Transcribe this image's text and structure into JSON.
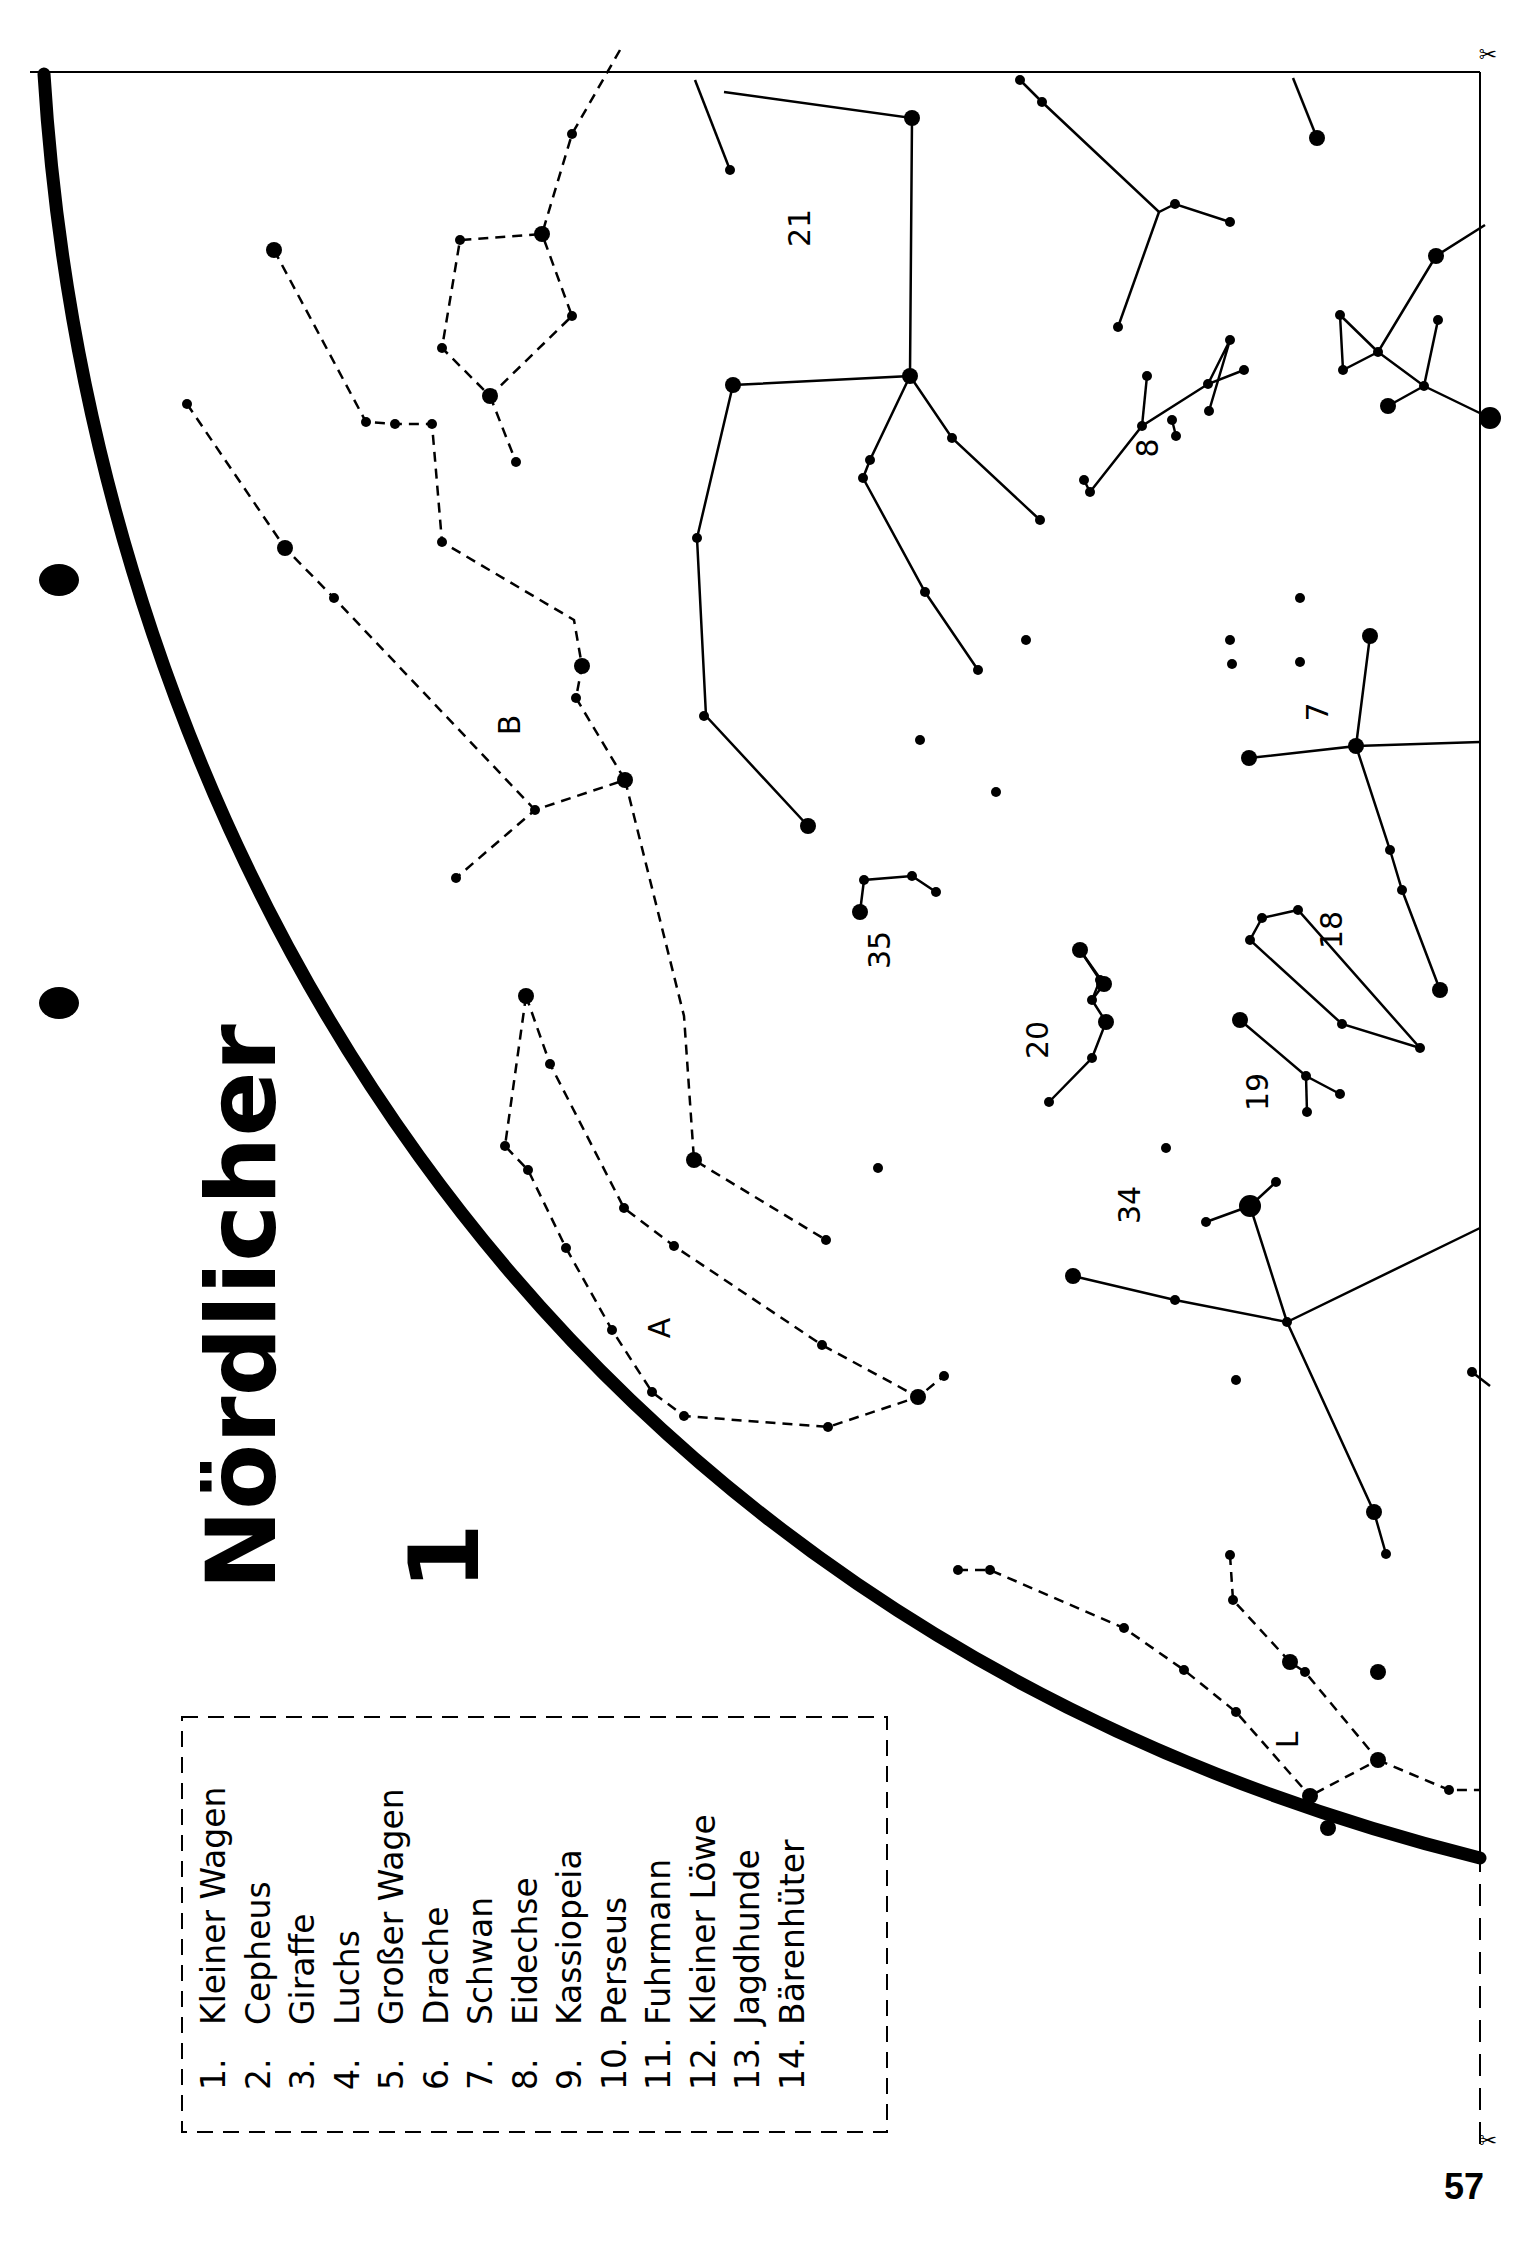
{
  "page": {
    "title": "Nördlicher",
    "sheet_number": "1",
    "page_number": "57",
    "ink_color": "#000000",
    "paper_color": "#ffffff"
  },
  "legend": {
    "items": [
      {
        "num": "1.",
        "name": "Kleiner Wagen"
      },
      {
        "num": "2.",
        "name": "Cepheus"
      },
      {
        "num": "3.",
        "name": "Giraffe"
      },
      {
        "num": "4.",
        "name": "Luchs"
      },
      {
        "num": "5.",
        "name": "Großer Wagen"
      },
      {
        "num": "6.",
        "name": "Drache"
      },
      {
        "num": "7.",
        "name": "Schwan"
      },
      {
        "num": "8.",
        "name": "Eidechse"
      },
      {
        "num": "9.",
        "name": "Kassiopeia"
      },
      {
        "num": "10.",
        "name": "Perseus"
      },
      {
        "num": "11.",
        "name": "Fuhrmann"
      },
      {
        "num": "12.",
        "name": "Kleiner Löwe"
      },
      {
        "num": "13.",
        "name": "Jagdhunde"
      },
      {
        "num": "14.",
        "name": "Bärenhüter"
      }
    ]
  },
  "map_labels": [
    {
      "id": "label-21",
      "text": "21",
      "x": 810,
      "y": 228
    },
    {
      "id": "label-8",
      "text": "8",
      "x": 1158,
      "y": 448
    },
    {
      "id": "label-7",
      "text": "7",
      "x": 1328,
      "y": 712
    },
    {
      "id": "label-18",
      "text": "18",
      "x": 1342,
      "y": 930
    },
    {
      "id": "label-35",
      "text": "35",
      "x": 890,
      "y": 950
    },
    {
      "id": "label-20",
      "text": "20",
      "x": 1048,
      "y": 1040
    },
    {
      "id": "label-19",
      "text": "19",
      "x": 1268,
      "y": 1092
    },
    {
      "id": "label-34",
      "text": "34",
      "x": 1140,
      "y": 1205
    },
    {
      "id": "label-A",
      "text": "A",
      "x": 670,
      "y": 1328
    },
    {
      "id": "label-B",
      "text": "B",
      "x": 520,
      "y": 725
    },
    {
      "id": "label-L",
      "text": "L",
      "x": 1298,
      "y": 1740
    }
  ],
  "constellations": {
    "dashed": [
      [
        [
          620,
          50
        ],
        [
          572,
          134
        ],
        [
          542,
          234
        ],
        [
          460,
          240
        ],
        [
          442,
          348
        ],
        [
          490,
          396
        ],
        [
          572,
          316
        ],
        [
          542,
          234
        ]
      ],
      [
        [
          490,
          396
        ],
        [
          516,
          462
        ]
      ],
      [
        [
          274,
          250
        ],
        [
          366,
          422
        ],
        [
          395,
          424
        ],
        [
          432,
          424
        ],
        [
          442,
          542
        ],
        [
          574,
          620
        ],
        [
          582,
          666
        ],
        [
          576,
          698
        ],
        [
          625,
          780
        ],
        [
          535,
          810
        ],
        [
          456,
          878
        ]
      ],
      [
        [
          187,
          404
        ],
        [
          285,
          548
        ],
        [
          334,
          598
        ],
        [
          535,
          810
        ]
      ],
      [
        [
          625,
          780
        ],
        [
          684,
          1016
        ],
        [
          694,
          1160
        ],
        [
          826,
          1240
        ]
      ],
      [
        [
          526,
          996
        ],
        [
          550,
          1064
        ],
        [
          624,
          1208
        ],
        [
          674,
          1246
        ],
        [
          822,
          1345
        ],
        [
          918,
          1397
        ],
        [
          944,
          1376
        ]
      ],
      [
        [
          526,
          996
        ],
        [
          505,
          1146
        ],
        [
          528,
          1170
        ],
        [
          566,
          1248
        ],
        [
          612,
          1330
        ],
        [
          652,
          1392
        ],
        [
          684,
          1416
        ],
        [
          828,
          1427
        ],
        [
          918,
          1397
        ]
      ],
      [
        [
          958,
          1570
        ],
        [
          990,
          1570
        ],
        [
          1124,
          1628
        ],
        [
          1184,
          1670
        ],
        [
          1236,
          1712
        ],
        [
          1310,
          1796
        ],
        [
          1328,
          1828
        ]
      ],
      [
        [
          1230,
          1555
        ],
        [
          1233,
          1600
        ],
        [
          1290,
          1662
        ],
        [
          1305,
          1672
        ],
        [
          1378,
          1760
        ],
        [
          1310,
          1796
        ]
      ],
      [
        [
          1378,
          1760
        ],
        [
          1449,
          1790
        ],
        [
          1480,
          1790
        ]
      ]
    ],
    "solid": [
      [
        [
          695,
          80
        ],
        [
          730,
          170
        ]
      ],
      [
        [
          724,
          92
        ],
        [
          912,
          118
        ],
        [
          910,
          376
        ],
        [
          733,
          385
        ],
        [
          697,
          538
        ],
        [
          706,
          716
        ],
        [
          808,
          826
        ]
      ],
      [
        [
          910,
          376
        ],
        [
          870,
          460
        ],
        [
          863,
          478
        ],
        [
          925,
          592
        ],
        [
          978,
          670
        ]
      ],
      [
        [
          910,
          376
        ],
        [
          952,
          438
        ],
        [
          1040,
          520
        ]
      ],
      [
        [
          1020,
          80
        ],
        [
          1042,
          102
        ],
        [
          1159,
          212
        ],
        [
          1175,
          204
        ],
        [
          1230,
          222
        ]
      ],
      [
        [
          1159,
          212
        ],
        [
          1118,
          327
        ]
      ],
      [
        [
          1293,
          78
        ],
        [
          1317,
          138
        ]
      ],
      [
        [
          1485,
          225
        ],
        [
          1436,
          256
        ],
        [
          1378,
          352
        ],
        [
          1424,
          386
        ],
        [
          1490,
          418
        ]
      ],
      [
        [
          1378,
          352
        ],
        [
          1343,
          370
        ],
        [
          1340,
          315
        ],
        [
          1378,
          352
        ]
      ],
      [
        [
          1424,
          386
        ],
        [
          1438,
          320
        ]
      ],
      [
        [
          1424,
          386
        ],
        [
          1388,
          406
        ]
      ],
      [
        [
          1084,
          480
        ],
        [
          1090,
          492
        ],
        [
          1142,
          426
        ],
        [
          1208,
          384
        ],
        [
          1244,
          370
        ]
      ],
      [
        [
          1142,
          426
        ],
        [
          1147,
          376
        ]
      ],
      [
        [
          1208,
          384
        ],
        [
          1230,
          340
        ],
        [
          1209,
          411
        ]
      ],
      [
        [
          1172,
          420
        ],
        [
          1176,
          436
        ]
      ],
      [
        [
          1370,
          636
        ],
        [
          1356,
          746
        ],
        [
          1249,
          758
        ]
      ],
      [
        [
          1356,
          746
        ],
        [
          1480,
          742
        ]
      ],
      [
        [
          1356,
          746
        ],
        [
          1390,
          850
        ],
        [
          1402,
          890
        ],
        [
          1440,
          990
        ]
      ],
      [
        [
          1262,
          918
        ],
        [
          1250,
          940
        ],
        [
          1342,
          1024
        ],
        [
          1420,
          1048
        ],
        [
          1298,
          910
        ],
        [
          1262,
          918
        ]
      ],
      [
        [
          1240,
          1020
        ],
        [
          1306,
          1076
        ],
        [
          1340,
          1094
        ]
      ],
      [
        [
          1306,
          1076
        ],
        [
          1307,
          1112
        ]
      ],
      [
        [
          860,
          912
        ],
        [
          864,
          880
        ],
        [
          912,
          876
        ],
        [
          936,
          892
        ]
      ],
      [
        [
          1080,
          950
        ],
        [
          1100,
          980
        ],
        [
          1092,
          1000
        ],
        [
          1106,
          1022
        ],
        [
          1092,
          1058
        ],
        [
          1049,
          1102
        ]
      ],
      [
        [
          1080,
          950
        ],
        [
          1104,
          984
        ]
      ],
      [
        [
          1092,
          1000
        ],
        [
          1104,
          984
        ]
      ],
      [
        [
          1073,
          1276
        ],
        [
          1175,
          1300
        ],
        [
          1287,
          1322
        ],
        [
          1480,
          1228
        ]
      ],
      [
        [
          1287,
          1322
        ],
        [
          1250,
          1206
        ],
        [
          1276,
          1182
        ]
      ],
      [
        [
          1250,
          1206
        ],
        [
          1206,
          1222
        ]
      ],
      [
        [
          1287,
          1322
        ],
        [
          1374,
          1512
        ],
        [
          1386,
          1554
        ]
      ],
      [
        [
          1472,
          1372
        ],
        [
          1490,
          1386
        ]
      ]
    ],
    "stars_small": [
      [
        572,
        134
      ],
      [
        460,
        240
      ],
      [
        442,
        348
      ],
      [
        572,
        316
      ],
      [
        516,
        462
      ],
      [
        366,
        422
      ],
      [
        395,
        424
      ],
      [
        432,
        424
      ],
      [
        442,
        542
      ],
      [
        576,
        698
      ],
      [
        535,
        810
      ],
      [
        456,
        878
      ],
      [
        187,
        404
      ],
      [
        334,
        598
      ],
      [
        694,
        1160
      ],
      [
        826,
        1240
      ],
      [
        550,
        1064
      ],
      [
        624,
        1208
      ],
      [
        674,
        1246
      ],
      [
        822,
        1345
      ],
      [
        944,
        1376
      ],
      [
        505,
        1146
      ],
      [
        528,
        1170
      ],
      [
        566,
        1248
      ],
      [
        612,
        1330
      ],
      [
        652,
        1392
      ],
      [
        684,
        1416
      ],
      [
        828,
        1427
      ],
      [
        958,
        1570
      ],
      [
        990,
        1570
      ],
      [
        1124,
        1628
      ],
      [
        1184,
        1670
      ],
      [
        1236,
        1712
      ],
      [
        1230,
        1555
      ],
      [
        1233,
        1600
      ],
      [
        1305,
        1672
      ],
      [
        1449,
        1790
      ],
      [
        730,
        170
      ],
      [
        1042,
        102
      ],
      [
        1175,
        204
      ],
      [
        1230,
        222
      ],
      [
        1118,
        327
      ],
      [
        1020,
        80
      ],
      [
        1317,
        138
      ],
      [
        870,
        460
      ],
      [
        863,
        478
      ],
      [
        925,
        592
      ],
      [
        978,
        670
      ],
      [
        952,
        438
      ],
      [
        1040,
        520
      ],
      [
        1084,
        480
      ],
      [
        1090,
        492
      ],
      [
        1142,
        426
      ],
      [
        1208,
        384
      ],
      [
        1147,
        376
      ],
      [
        1230,
        340
      ],
      [
        1209,
        411
      ],
      [
        1172,
        420
      ],
      [
        1176,
        436
      ],
      [
        1244,
        370
      ],
      [
        1343,
        370
      ],
      [
        1340,
        315
      ],
      [
        1438,
        320
      ],
      [
        1424,
        386
      ],
      [
        1378,
        352
      ],
      [
        1390,
        850
      ],
      [
        1402,
        890
      ],
      [
        1262,
        918
      ],
      [
        1250,
        940
      ],
      [
        1342,
        1024
      ],
      [
        1420,
        1048
      ],
      [
        1298,
        910
      ],
      [
        1306,
        1076
      ],
      [
        1340,
        1094
      ],
      [
        1307,
        1112
      ],
      [
        864,
        880
      ],
      [
        912,
        876
      ],
      [
        936,
        892
      ],
      [
        1092,
        1000
      ],
      [
        1100,
        980
      ],
      [
        1092,
        1058
      ],
      [
        1049,
        1102
      ],
      [
        1175,
        1300
      ],
      [
        1287,
        1322
      ],
      [
        1206,
        1222
      ],
      [
        1276,
        1182
      ],
      [
        1386,
        1554
      ],
      [
        1472,
        1372
      ],
      [
        1230,
        640
      ],
      [
        1232,
        664
      ],
      [
        1300,
        598
      ],
      [
        1300,
        662
      ],
      [
        1026,
        640
      ],
      [
        920,
        740
      ],
      [
        996,
        792
      ],
      [
        878,
        1168
      ],
      [
        1166,
        1148
      ],
      [
        1236,
        1380
      ],
      [
        704,
        716
      ],
      [
        697,
        538
      ]
    ],
    "stars_large": [
      [
        542,
        234
      ],
      [
        490,
        396
      ],
      [
        274,
        250
      ],
      [
        285,
        548
      ],
      [
        625,
        780
      ],
      [
        582,
        666
      ],
      [
        694,
        1160
      ],
      [
        526,
        996
      ],
      [
        918,
        1397
      ],
      [
        1290,
        1662
      ],
      [
        1310,
        1796
      ],
      [
        1378,
        1760
      ],
      [
        1328,
        1828
      ],
      [
        912,
        118
      ],
      [
        910,
        376
      ],
      [
        733,
        385
      ],
      [
        808,
        826
      ],
      [
        1317,
        138
      ],
      [
        1436,
        256
      ],
      [
        1388,
        406
      ],
      [
        1490,
        418
      ],
      [
        1370,
        636
      ],
      [
        1356,
        746
      ],
      [
        1249,
        758
      ],
      [
        1440,
        990
      ],
      [
        860,
        912
      ],
      [
        1080,
        950
      ],
      [
        1104,
        984
      ],
      [
        1106,
        1022
      ],
      [
        1073,
        1276
      ],
      [
        1250,
        1206
      ],
      [
        1374,
        1512
      ],
      [
        1378,
        1672
      ],
      [
        1240,
        1020
      ]
    ],
    "stars_huge": [
      [
        1490,
        418
      ],
      [
        1250,
        1206
      ]
    ]
  },
  "decorations": {
    "hole_punches": [
      [
        59,
        580
      ],
      [
        59,
        1003
      ]
    ],
    "scissors": [
      [
        1488,
        62
      ],
      [
        1488,
        2148
      ]
    ]
  }
}
